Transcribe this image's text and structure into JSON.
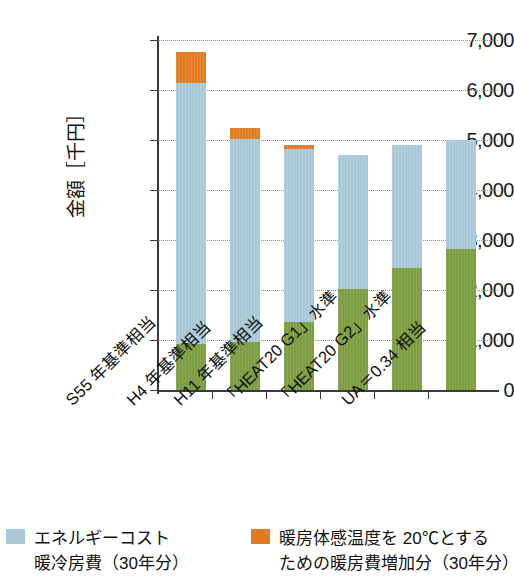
{
  "chart_data": {
    "type": "bar",
    "stacked": true,
    "title": "",
    "xlabel": "",
    "ylabel": "金額［千円］",
    "ylim": [
      0,
      7000
    ],
    "ytick_labels": [
      "7,000",
      "6,000",
      "5,000",
      "4,000",
      "3,000",
      "2,000",
      "1,000",
      "0"
    ],
    "ytick_values": [
      7000,
      6000,
      5000,
      4000,
      3000,
      2000,
      1000,
      0
    ],
    "grid": true,
    "legend_position": "bottom",
    "categories": [
      "S55 年基準相当",
      "H4 年基準相当",
      "H11 年基準相当",
      "「HEAT20 G1」水準",
      "「HEAT20 G2」水準",
      "UA＝0.34 相当"
    ],
    "series": [
      {
        "name": "建設コスト（緑）",
        "color": "#7d9d42",
        "values": [
          920,
          970,
          1360,
          2020,
          2450,
          2820
        ]
      },
      {
        "name": "エネルギーコスト 暖冷房費（30年分）",
        "color": "#a8c8d8",
        "values": [
          5230,
          4060,
          3470,
          2680,
          2450,
          2180
        ]
      },
      {
        "name": "暖房体感温度を 20℃とするための暖房費増加分（30年分）",
        "color": "#e07b22",
        "values": [
          610,
          220,
          70,
          0,
          0,
          0
        ]
      }
    ],
    "totals": [
      6760,
      5250,
      4900,
      4700,
      4900,
      5000
    ]
  },
  "axis": {
    "y_title": "金額［千円］"
  },
  "legend": {
    "items": [
      {
        "label": "エネルギーコスト\n暖冷房費（30年分）",
        "color": "#a8c8d8",
        "swatch_name": "legend-swatch-energy-cost"
      },
      {
        "label": "暖房体感温度を 20℃とする\nための暖房費増加分（30年分）",
        "color": "#e07b22",
        "swatch_name": "legend-swatch-heating-increase"
      }
    ]
  },
  "colors": {
    "green": "#7d9d42",
    "blue": "#a8c8d8",
    "orange": "#e07b22",
    "axis": "#3a3a3a",
    "grid": "#8d8d8d"
  }
}
